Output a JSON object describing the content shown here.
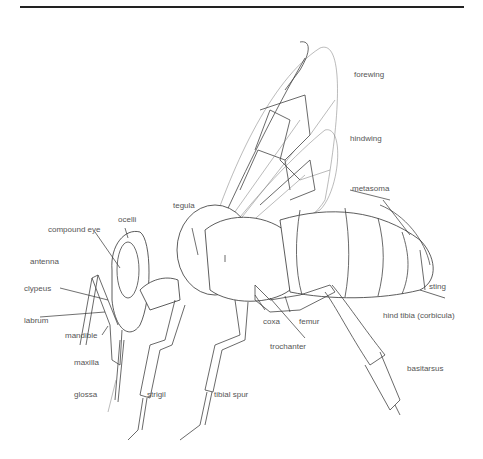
{
  "diagram": {
    "colors": {
      "lines": "#333333",
      "labels": "#555555",
      "background": "#ffffff",
      "rule": "#222222"
    },
    "labels": {
      "forewing": "forewing",
      "hindwing": "hindwing",
      "metasoma": "metasoma",
      "tegula": "tegula",
      "ocelli": "ocelli",
      "compound_eye": "compound eye",
      "antenna": "antenna",
      "clypeus": "clypeus",
      "labrum": "labrum",
      "mandible": "mandible",
      "maxilla": "maxilla",
      "glossa": "glossa",
      "strigil": "strigil",
      "tibial_spur": "tibial spur",
      "coxa": "coxa",
      "trochanter": "trochanter",
      "femur": "femur",
      "sting": "sting",
      "hind_tibia": "hind tibia (corbicula)",
      "basitarsus": "basitarsus"
    }
  }
}
